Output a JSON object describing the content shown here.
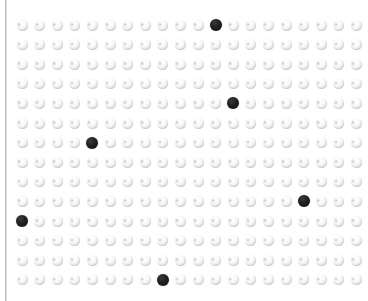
{
  "canvas": {
    "width": 368,
    "height": 301,
    "background_color": "#ffffff",
    "description": "Dot matrix grid of pale spherical markers with a few highlighted dark markers"
  },
  "left_rule": {
    "name": "left-border-rule",
    "color": "#b9b9b9",
    "soft_color": "#e2e2e2",
    "x": 5,
    "width": 1
  },
  "grid": {
    "columns": 20,
    "rows": 14,
    "origin_x": 22,
    "origin_y": 25,
    "step_x": 17.6,
    "step_y": 19.6,
    "dot_diameter": 11,
    "light_dot_color": "#ededed",
    "light_dot_highlight": "#ffffff",
    "dark_dot_color": "#1a1a1a"
  },
  "dark_dots": [
    {
      "col": 12,
      "row": 1,
      "x": 222,
      "y": 25
    },
    {
      "col": 13,
      "row": 5,
      "x": 239,
      "y": 96
    },
    {
      "col": 5,
      "row": 7,
      "x": 93,
      "y": 152
    },
    {
      "col": 17,
      "row": 10,
      "x": 308,
      "y": 208
    },
    {
      "col": 1,
      "row": 11,
      "x": 22,
      "y": 228
    },
    {
      "col": 9,
      "row": 14,
      "x": 168,
      "y": 281
    }
  ],
  "chart_data": {
    "type": "scatter",
    "title": "",
    "subtitle": "",
    "xlabel": "",
    "ylabel": "",
    "xlim": [
      1,
      20
    ],
    "ylim": [
      1,
      14
    ],
    "grid": true,
    "legend": null,
    "categories": [],
    "series": [
      {
        "name": "inactive-cells",
        "marker": "pale-sphere",
        "color": "#ededed",
        "count": 274
      },
      {
        "name": "highlighted-cells",
        "marker": "dark-sphere",
        "color": "#1a1a1a",
        "count": 6,
        "points": [
          [
            12,
            1
          ],
          [
            13,
            5
          ],
          [
            5,
            7
          ],
          [
            17,
            10
          ],
          [
            1,
            11
          ],
          [
            9,
            14
          ]
        ]
      }
    ],
    "annotations": []
  }
}
